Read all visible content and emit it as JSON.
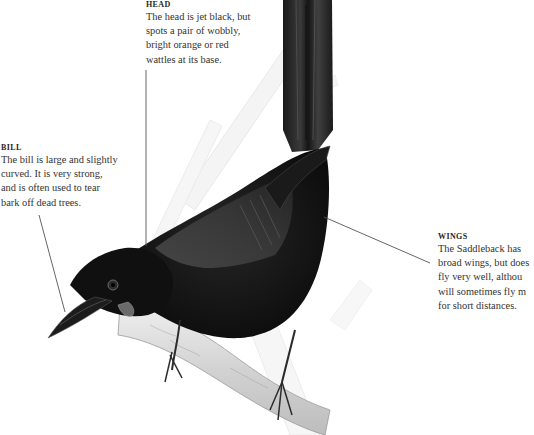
{
  "subject": "Saddleback",
  "callouts": {
    "head": {
      "heading": "HEAD",
      "lines": [
        "The head is jet black, but",
        "spots a pair of wobbly,",
        "bright orange or red",
        "wattles at its base."
      ]
    },
    "bill": {
      "heading": "BILL",
      "lines": [
        "The bill is large and slightly",
        "curved. It is very strong,",
        "and is often used to tear",
        "bark off dead trees."
      ]
    },
    "wings": {
      "heading": "WINGS",
      "lines": [
        "The Saddleback has",
        "broad wings, but does",
        "fly very well, althou",
        "will sometimes fly m",
        "for short distances."
      ]
    }
  },
  "colors": {
    "background": "#ffffff",
    "text": "#333333",
    "leader_line": "#555555",
    "plumage": "#141414",
    "saddle": "#3b3b3b",
    "branch": "#d8d8d8"
  }
}
